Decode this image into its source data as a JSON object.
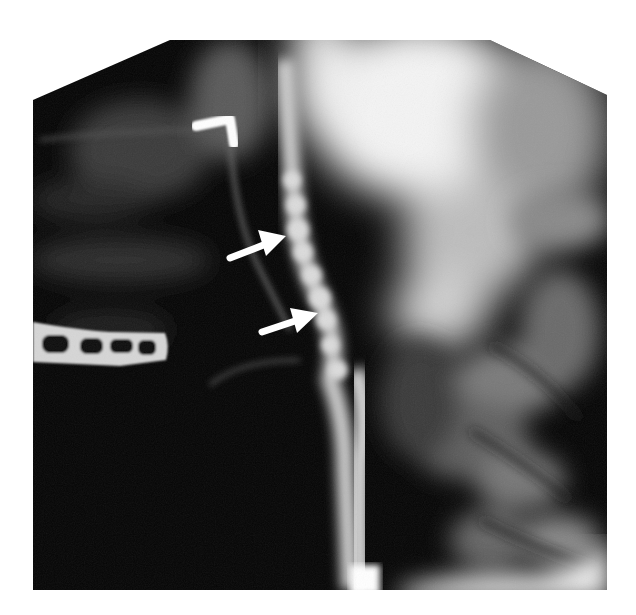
{
  "image": {
    "kind": "radiograph",
    "description": "Lateral cervical angiogram showing a contrast-filled vertebral/carotid artery with beaded irregular segments",
    "background_color": "#ffffff",
    "field_color": "#050505"
  },
  "annotations": {
    "arrows": [
      {
        "label": "upper-arrow",
        "tail": [
          230,
          258
        ],
        "head": [
          285,
          236
        ],
        "color": "#ffffff"
      },
      {
        "label": "lower-arrow",
        "tail": [
          262,
          332
        ],
        "head": [
          317,
          313
        ],
        "color": "#ffffff"
      }
    ]
  },
  "structures": {
    "surgical_clip": {
      "shape": "L-bracket",
      "color": "#ffffff"
    },
    "fixation_plate": {
      "holes": 4,
      "color": "#d8d8d8"
    }
  }
}
